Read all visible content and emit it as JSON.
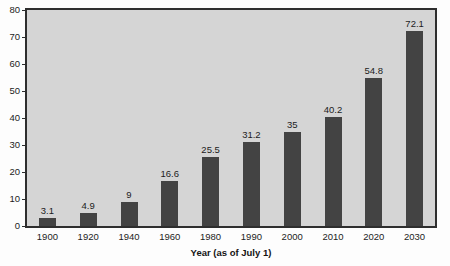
{
  "chart_data": {
    "type": "bar",
    "title": "",
    "xlabel": "Year (as of July 1)",
    "ylabel": "",
    "categories": [
      "1900",
      "1920",
      "1940",
      "1960",
      "1980",
      "1990",
      "2000",
      "2010",
      "2020",
      "2030"
    ],
    "values": [
      3.1,
      4.9,
      9,
      16.6,
      25.5,
      31.2,
      35,
      40.2,
      54.8,
      72.1
    ],
    "value_labels": [
      "3.1",
      "4.9",
      "9",
      "16.6",
      "25.5",
      "31.2",
      "35",
      "40.2",
      "54.8",
      "72.1"
    ],
    "ylim": [
      0,
      80
    ],
    "yticks": [
      0,
      10,
      20,
      30,
      40,
      50,
      60,
      70,
      80
    ],
    "ytick_labels": [
      "0",
      "10",
      "20",
      "30",
      "40",
      "50",
      "60",
      "70",
      "80"
    ],
    "grid": false,
    "legend": null,
    "legend_position": "none",
    "colors": {
      "bar": "#434343",
      "plot_background": "#d5d5d5",
      "figure_background": "#fdfdfd",
      "axis": "#2e2e2e",
      "text": "#1c1c1c"
    }
  }
}
